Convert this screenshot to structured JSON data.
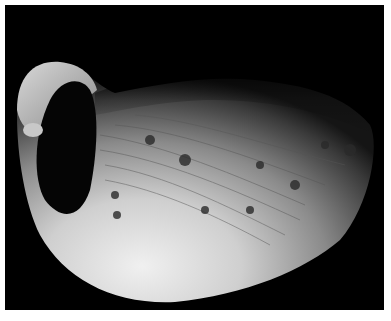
{
  "image": {
    "subject": "Phobos (moon of Mars), grayscale photograph",
    "background_color": "#000000",
    "border_color": "#ffffff",
    "colors": {
      "bright_surface": "#e6e6e6",
      "mid_surface": "#9a9a9a",
      "dark_surface": "#3a3a3a",
      "crater_shadow": "#050505"
    }
  }
}
